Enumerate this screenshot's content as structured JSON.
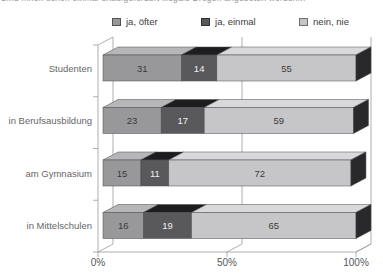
{
  "chart_data": {
    "type": "bar",
    "variant": "stacked-horizontal-3d",
    "title": "Sind Ihnen schon einmal unaufgefordert illegale Drogen angeboten worden...",
    "categories": [
      "Studenten",
      "in Berufsausbildung",
      "am Gymnasium",
      "in Mittelschulen"
    ],
    "series": [
      {
        "name": "ja, öfter",
        "values": [
          31,
          23,
          15,
          16
        ],
        "color": "#98989a",
        "top_color": "#b6b6b8",
        "label_color": "#3a3a3a"
      },
      {
        "name": "ja, einmal",
        "values": [
          14,
          17,
          11,
          19
        ],
        "color": "#59595b",
        "top_color": "#1d1d1f",
        "label_color": "#f0f0f0"
      },
      {
        "name": "nein, nie",
        "values": [
          55,
          59,
          72,
          65
        ],
        "color": "#c6c6c8",
        "top_color": "#d9d9db",
        "label_color": "#3a3a3a"
      }
    ],
    "x_ticks": [
      "0%",
      "50%",
      "100%"
    ],
    "x_tick_values": [
      0,
      50,
      100
    ],
    "xlim": [
      0,
      100
    ],
    "legend_position": "top",
    "grid": true,
    "end_cap_color": "#29292b",
    "axis_color": "#9a9a9a",
    "outline_color": "#48484a"
  }
}
